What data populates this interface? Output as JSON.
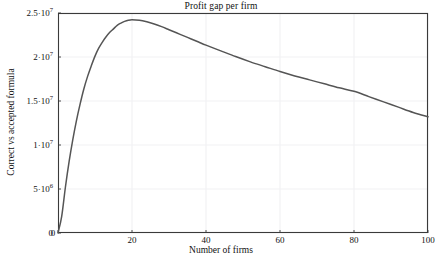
{
  "chart_data": {
    "type": "line",
    "title": "Profit gap per firm",
    "xlabel": "Number of firms",
    "ylabel": "Correct vs accepted formula",
    "xlim": [
      0,
      100
    ],
    "ylim": [
      0,
      25000000
    ],
    "grid": true,
    "legend": null,
    "xticks": [
      {
        "value": 0,
        "label": "0"
      },
      {
        "value": 20,
        "label": "20"
      },
      {
        "value": 40,
        "label": "40"
      },
      {
        "value": 60,
        "label": "60"
      },
      {
        "value": 80,
        "label": "80"
      },
      {
        "value": 100,
        "label": "100"
      }
    ],
    "yticks": [
      {
        "value": 0,
        "mantissa": "0",
        "exponent": "",
        "label": "0"
      },
      {
        "value": 5000000,
        "mantissa": "5·10",
        "exponent": "6",
        "label": "5·10^6"
      },
      {
        "value": 10000000,
        "mantissa": "1·10",
        "exponent": "7",
        "label": "1·10^7"
      },
      {
        "value": 15000000,
        "mantissa": "1.5·10",
        "exponent": "7",
        "label": "1.5·10^7"
      },
      {
        "value": 20000000,
        "mantissa": "2·10",
        "exponent": "7",
        "label": "2·10^7"
      },
      {
        "value": 25000000,
        "mantissa": "2.5·10",
        "exponent": "7",
        "label": "2.5·10^7"
      }
    ],
    "series": [
      {
        "name": "Profit gap per firm",
        "color": "#555555",
        "x": [
          0,
          1,
          2,
          3,
          4,
          5,
          6,
          7,
          8,
          9,
          10,
          11,
          12,
          13,
          14,
          15,
          16,
          17,
          18,
          19,
          20,
          22,
          24,
          26,
          28,
          30,
          32,
          34,
          36,
          38,
          40,
          44,
          48,
          52,
          56,
          60,
          64,
          68,
          72,
          76,
          80,
          84,
          88,
          92,
          96,
          100
        ],
        "y": [
          0,
          1900000,
          5200000,
          8100000,
          10600000,
          12800000,
          14700000,
          16400000,
          17800000,
          19000000,
          20100000,
          21000000,
          21700000,
          22300000,
          22800000,
          23200000,
          23600000,
          23850000,
          24050000,
          24180000,
          24230000,
          24180000,
          24000000,
          23750000,
          23450000,
          23100000,
          22750000,
          22400000,
          22050000,
          21700000,
          21350000,
          20700000,
          20050000,
          19450000,
          18900000,
          18350000,
          17850000,
          17400000,
          16950000,
          16500000,
          16100000,
          15500000,
          14900000,
          14300000,
          13700000,
          13200000
        ]
      }
    ],
    "peak": {
      "x": 20,
      "y": 24230000
    },
    "endpoint": {
      "x": 100,
      "y": 13200000
    }
  },
  "plot_area": {
    "left": 58,
    "top": 13,
    "right": 428,
    "bottom": 233
  },
  "colors": {
    "curve": "#555555",
    "frame": "#3a3a3a",
    "grid": "#f2f2f4",
    "background": "#ffffff",
    "text": "#111111"
  }
}
